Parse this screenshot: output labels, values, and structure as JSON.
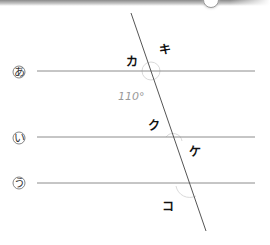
{
  "figure": {
    "colors": {
      "line": "#8c8c8c",
      "transversal": "#555555",
      "arc": "#d8d8d8",
      "given_angle_text": "#9a9a9a",
      "label_text": "#111111"
    },
    "parallel_lines": [
      {
        "label": "あ",
        "y": 71
      },
      {
        "label": "い",
        "y": 137
      },
      {
        "label": "う",
        "y": 183
      }
    ],
    "transversal": {
      "x1": 131,
      "y1": 13,
      "x2": 206,
      "y2": 231
    },
    "given_angle": "110°",
    "angle_labels": [
      "カ",
      "キ",
      "ク",
      "ケ",
      "コ"
    ]
  }
}
